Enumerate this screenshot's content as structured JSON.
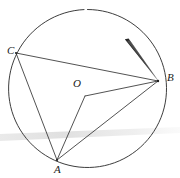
{
  "figure": {
    "background_color": "#ffffff",
    "stroke_color": "#2b2b2b",
    "pencil_color": "#1a1a1a",
    "smudge_color": "#dcdcdc",
    "width": 180,
    "height": 178
  },
  "circle": {
    "name": "main-circle",
    "center_x": 87.5,
    "center_y": 88.5,
    "radius": 79,
    "stroke_width": 0.9,
    "gap_start_deg": 265,
    "gap_end_deg": 276
  },
  "points": [
    {
      "id": "C",
      "label": "C",
      "x": 16,
      "y": 53
    },
    {
      "id": "B",
      "label": "B",
      "x": 158,
      "y": 81
    },
    {
      "id": "O",
      "label": "O",
      "x": 85,
      "y": 96
    },
    {
      "id": "A",
      "label": "A",
      "x": 57,
      "y": 160
    }
  ],
  "labels": {
    "C": "C",
    "B": "B",
    "O": "O",
    "A": "A"
  },
  "segments": [
    {
      "name": "segment-CB",
      "from": "C",
      "to": "B"
    },
    {
      "name": "segment-CA",
      "from": "C",
      "to": "A"
    },
    {
      "name": "segment-OB",
      "from": "O",
      "to": "B"
    },
    {
      "name": "segment-OA",
      "from": "O",
      "to": "A"
    },
    {
      "name": "segment-AB",
      "from": "A",
      "to": "B"
    }
  ],
  "pencil": {
    "name": "pencil-tip",
    "tip_x": 158,
    "tip_y": 80,
    "tail_x": 126,
    "tail_y": 40,
    "width_at_tail": 5
  },
  "scan_band": {
    "name": "scanner-smudge-band",
    "left_y": 137,
    "right_y": 130,
    "thickness": 5,
    "color": "#e2e2e2"
  }
}
